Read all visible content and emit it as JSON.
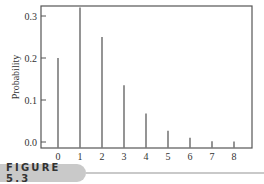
{
  "figure": {
    "label": "FIGURE 5.3"
  },
  "chart_data": {
    "type": "bar",
    "title": "",
    "xlabel": "",
    "ylabel": "Probability",
    "categories": [
      "0",
      "1",
      "2",
      "3",
      "4",
      "5",
      "6",
      "7",
      "8"
    ],
    "values": [
      0.2,
      0.32,
      0.25,
      0.135,
      0.068,
      0.027,
      0.01,
      0.002,
      0.001
    ],
    "ylim": [
      0.0,
      0.32
    ],
    "yticks": [
      "0.0",
      "0.1",
      "0.2",
      "0.3"
    ],
    "ytick_values": [
      0.0,
      0.1,
      0.2,
      0.3
    ],
    "grid": false,
    "legend": null,
    "style": "spike",
    "bar_color": "#7a7a7a",
    "frame_color": "#555555"
  }
}
